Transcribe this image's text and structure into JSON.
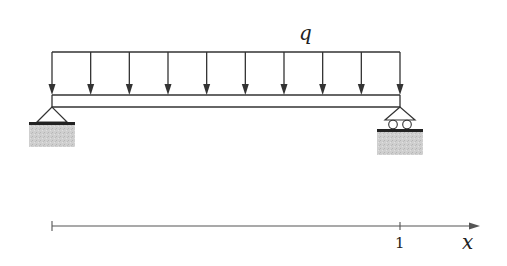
{
  "diagram": {
    "type": "simply-supported-beam",
    "load": {
      "label": "q",
      "kind": "uniformly-distributed",
      "arrow_count": 10,
      "x_start": 52,
      "x_end": 400,
      "y_top": 52,
      "y_tip": 95
    },
    "beam": {
      "x_start": 52,
      "x_end": 400,
      "y_top": 95,
      "y_bottom": 107
    },
    "supports": [
      {
        "name": "left-support",
        "kind": "pin",
        "x": 52
      },
      {
        "name": "right-support",
        "kind": "roller",
        "x": 400
      }
    ],
    "axis": {
      "label": "x",
      "tick_label": "1",
      "x_start": 52,
      "tick_x": 400,
      "x_end": 478,
      "y": 226
    },
    "colors": {
      "stroke": "#333333",
      "ground_fill": "#c8c8c8",
      "ground_bar": "#222222",
      "axis": "#555555"
    }
  }
}
